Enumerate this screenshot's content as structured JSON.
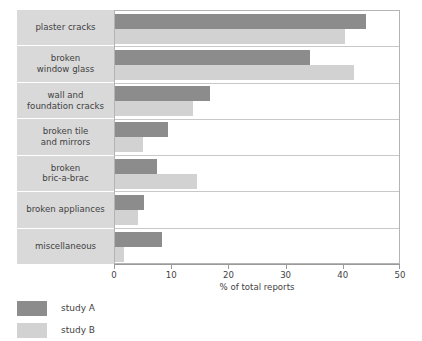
{
  "chart_data": {
    "type": "bar",
    "orientation": "horizontal",
    "title": "",
    "xlabel": "% of total reports",
    "ylabel": "",
    "xlim": [
      0,
      50
    ],
    "xticks": [
      0,
      10,
      20,
      30,
      40,
      50
    ],
    "xtick_labels": [
      "0",
      "10",
      "20",
      "30",
      "40",
      "50"
    ],
    "grid": false,
    "legend_position": "bottom-left",
    "categories": [
      "plaster cracks",
      "broken\nwindow glass",
      "wall and\nfoundation cracks",
      "broken tile\nand mirrors",
      "broken\nbric-a-brac",
      "broken appliances",
      "miscellaneous"
    ],
    "series": [
      {
        "name": "study A",
        "color": "#8c8c8c",
        "values": [
          44.2,
          34.4,
          16.8,
          9.3,
          7.4,
          5.1,
          8.2
        ]
      },
      {
        "name": "study B",
        "color": "#d2d2d2",
        "values": [
          40.5,
          42.0,
          13.7,
          4.9,
          14.5,
          4.0,
          1.6
        ]
      }
    ]
  },
  "legend": {
    "items": [
      {
        "label": "study A",
        "color": "#8c8c8c"
      },
      {
        "label": "study B",
        "color": "#d2d2d2"
      }
    ]
  },
  "colors": {
    "study_a": "#8c8c8c",
    "study_b": "#d2d2d2",
    "label_panel_bg": "#d9d9d9",
    "plot_border": "#b4b4b4",
    "row_divider": "#c8c8c8",
    "axis": "#9a9a9a",
    "text": "#3f3f3f"
  }
}
